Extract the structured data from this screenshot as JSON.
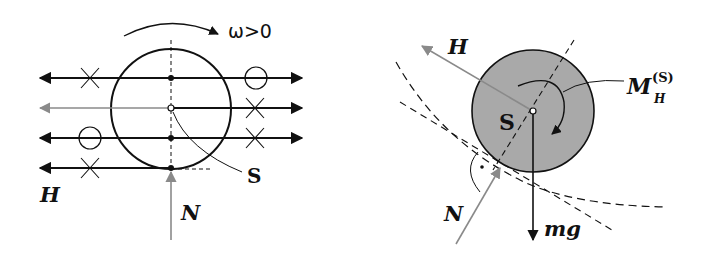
{
  "figure": {
    "left_panel": {
      "rotation_label": "ω>0",
      "center_label": "S",
      "horizontal_force_label": "H",
      "normal_force_label": "N"
    },
    "right_panel": {
      "horizontal_force_label": "H",
      "center_label": "S",
      "moment_label_main": "M",
      "moment_label_sup": "(S)",
      "moment_label_sub": "H",
      "normal_force_label": "N",
      "weight_label": "mg"
    },
    "colors": {
      "line": "#111111",
      "gray_arrow": "#8a8a8a",
      "disk_fill": "#a9a9a9"
    }
  }
}
